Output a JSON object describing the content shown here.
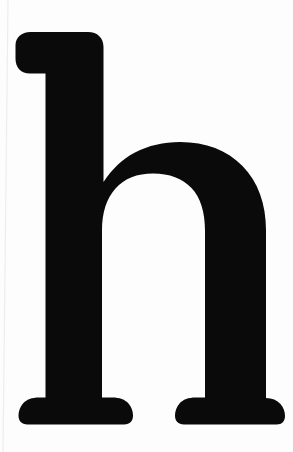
{
  "image": {
    "kind": "letterform-specimen",
    "subject": "lowercase letter h",
    "character": "h",
    "letter_case": "lowercase",
    "script": "Latin",
    "style": "serif",
    "alt_text": "A large black lowercase serif letter h on a white background",
    "width": 293,
    "height": 452
  },
  "colors": {
    "background": "#fdfdfd",
    "ink": "#0a0a0a",
    "artifact_line": "#ededed"
  },
  "glyph_metrics": {
    "ascender_top_y": 32,
    "baseline_y": 425,
    "x_height_top_y": 155,
    "stem_left_x": 45,
    "stem_right_x": 103,
    "beak_left_x": 15,
    "right_stem_right_x": 268,
    "counter_left_x": 105,
    "counter_right_x": 205,
    "counter_top_y": 190,
    "counter_bottom_y": 400,
    "left_foot_serif_left_x": 18,
    "left_foot_serif_right_x": 133,
    "right_foot_serif_left_x": 175,
    "right_foot_serif_right_x": 285
  },
  "glyph_path": "M 15.5 45.5 C 15.5 37.5 21.5 32.0 30.5 32.0 L 88.0 32.0 C 97.5 32.0 103.5 38.0 103.5 47.0 L 103.5 182.0 C 112.0 169.0 122.5 159.0 135.0 152.5 C 148.5 145.5 163.5 142.0 180.0 142.0 C 206.0 142.0 227.0 150.0 242.5 166.0 C 258.0 182.0 266.0 203.5 266.0 230.5 L 266.0 398.0 C 272.0 398.0 277.0 400.0 280.5 404.0 C 283.5 407.5 285.0 411.5 285.0 416.0 C 285.0 421.0 282.0 424.5 276.5 424.5 L 184.0 424.5 C 178.0 424.5 175.0 421.0 175.0 415.5 C 175.0 411.0 176.5 407.0 179.5 403.5 C 183.0 399.5 188.5 397.5 195.5 397.5 L 205.0 397.5 L 205.0 231.0 C 205.0 212.0 200.5 197.5 191.5 188.0 C 182.5 178.5 169.5 173.5 153.0 173.5 C 137.0 173.5 124.5 178.5 115.5 188.5 C 106.5 198.5 102.0 212.5 102.0 230.5 L 102.0 397.5 L 112.5 397.5 C 119.5 397.5 125.0 399.5 128.5 403.5 C 131.5 407.0 133.0 411.0 133.0 415.5 C 133.0 421.0 130.0 424.5 124.0 424.5 L 27.5 424.5 C 21.5 424.5 18.5 421.0 18.5 415.5 C 18.5 411.0 20.0 407.0 23.0 403.5 C 26.5 399.5 32.0 397.5 39.0 397.5 L 45.5 397.5 L 45.5 73.5 L 30.0 73.5 C 21.0 73.5 15.5 67.5 15.5 58.5 Z"
}
